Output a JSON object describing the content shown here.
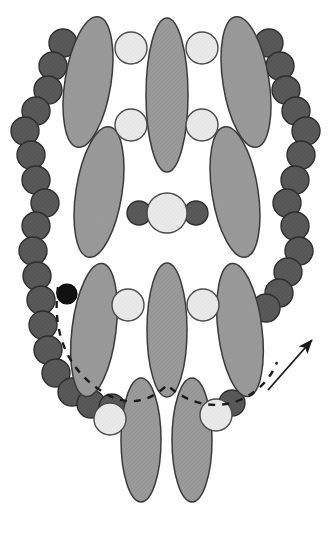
{
  "figure": {
    "background_color": "#ffffff",
    "width": 334,
    "height": 534
  },
  "palette": {
    "ellipse_fill": "#9a9a9a",
    "ellipse_stroke": "#3a3a3a",
    "dark_circle_fill": "#595959",
    "dark_circle_stroke": "#2e2e2e",
    "light_circle_fill": "#e9e9e9",
    "light_circle_stroke": "#4a4a4a",
    "black_circle_fill": "#111111",
    "black_circle_stroke": "#000000",
    "dashed_curve_color": "#1a1a1a",
    "arrow_color": "#1a1a1a"
  },
  "ellipses": [
    {
      "name": "ellipse-upper-left-outer",
      "cx": 88,
      "cy": 82,
      "rx": 23,
      "ry": 66,
      "rotate": 9
    },
    {
      "name": "ellipse-upper-left-inner",
      "cx": 99,
      "cy": 192,
      "rx": 23,
      "ry": 66,
      "rotate": 9
    },
    {
      "name": "ellipse-upper-center",
      "cx": 167,
      "cy": 95,
      "rx": 21,
      "ry": 77,
      "rotate": 0
    },
    {
      "name": "ellipse-upper-right-outer",
      "cx": 246,
      "cy": 82,
      "rx": 23,
      "ry": 66,
      "rotate": -9
    },
    {
      "name": "ellipse-upper-right-inner",
      "cx": 235,
      "cy": 192,
      "rx": 23,
      "ry": 66,
      "rotate": -9
    },
    {
      "name": "ellipse-lower-left",
      "cx": 94,
      "cy": 330,
      "rx": 22,
      "ry": 67,
      "rotate": 7
    },
    {
      "name": "ellipse-lower-center",
      "cx": 167,
      "cy": 330,
      "rx": 20,
      "ry": 67,
      "rotate": 0
    },
    {
      "name": "ellipse-lower-right",
      "cx": 240,
      "cy": 330,
      "rx": 22,
      "ry": 67,
      "rotate": -7
    },
    {
      "name": "ellipse-bottom-left",
      "cx": 141,
      "cy": 440,
      "rx": 20,
      "ry": 62,
      "rotate": 0
    },
    {
      "name": "ellipse-bottom-right",
      "cx": 192,
      "cy": 440,
      "rx": 20,
      "ry": 62,
      "rotate": 0
    }
  ],
  "dark_circles": [
    {
      "name": "dark-circle-l-01",
      "cx": 63,
      "cy": 43,
      "r": 14
    },
    {
      "name": "dark-circle-l-02",
      "cx": 53,
      "cy": 66,
      "r": 14
    },
    {
      "name": "dark-circle-l-03",
      "cx": 48,
      "cy": 90,
      "r": 14
    },
    {
      "name": "dark-circle-l-04",
      "cx": 36,
      "cy": 111,
      "r": 14
    },
    {
      "name": "dark-circle-l-05",
      "cx": 25,
      "cy": 131,
      "r": 14
    },
    {
      "name": "dark-circle-l-06",
      "cx": 31,
      "cy": 155,
      "r": 14
    },
    {
      "name": "dark-circle-l-07",
      "cx": 36,
      "cy": 180,
      "r": 14
    },
    {
      "name": "dark-circle-l-08",
      "cx": 45,
      "cy": 203,
      "r": 14
    },
    {
      "name": "dark-circle-l-09",
      "cx": 36,
      "cy": 226,
      "r": 14
    },
    {
      "name": "dark-circle-l-10",
      "cx": 33,
      "cy": 251,
      "r": 14
    },
    {
      "name": "dark-circle-l-11",
      "cx": 37,
      "cy": 276,
      "r": 14
    },
    {
      "name": "dark-circle-l-12",
      "cx": 41,
      "cy": 300,
      "r": 14
    },
    {
      "name": "dark-circle-l-13",
      "cx": 43,
      "cy": 325,
      "r": 14
    },
    {
      "name": "dark-circle-l-14",
      "cx": 48,
      "cy": 350,
      "r": 14
    },
    {
      "name": "dark-circle-l-15",
      "cx": 56,
      "cy": 373,
      "r": 14
    },
    {
      "name": "dark-circle-l-16",
      "cx": 72,
      "cy": 392,
      "r": 14
    },
    {
      "name": "dark-circle-l-17",
      "cx": 91,
      "cy": 404,
      "r": 14
    },
    {
      "name": "dark-circle-r-01",
      "cx": 269,
      "cy": 43,
      "r": 14
    },
    {
      "name": "dark-circle-r-02",
      "cx": 280,
      "cy": 66,
      "r": 14
    },
    {
      "name": "dark-circle-r-03",
      "cx": 286,
      "cy": 90,
      "r": 14
    },
    {
      "name": "dark-circle-r-04",
      "cx": 296,
      "cy": 111,
      "r": 14
    },
    {
      "name": "dark-circle-r-05",
      "cx": 306,
      "cy": 131,
      "r": 14
    },
    {
      "name": "dark-circle-r-06",
      "cx": 301,
      "cy": 155,
      "r": 14
    },
    {
      "name": "dark-circle-r-07",
      "cx": 295,
      "cy": 180,
      "r": 14
    },
    {
      "name": "dark-circle-r-08",
      "cx": 287,
      "cy": 203,
      "r": 14
    },
    {
      "name": "dark-circle-r-09",
      "cx": 295,
      "cy": 226,
      "r": 14
    },
    {
      "name": "dark-circle-r-10",
      "cx": 299,
      "cy": 251,
      "r": 14
    },
    {
      "name": "dark-circle-r-11",
      "cx": 288,
      "cy": 272,
      "r": 14
    },
    {
      "name": "dark-circle-r-12",
      "cx": 279,
      "cy": 293,
      "r": 14
    },
    {
      "name": "dark-circle-r-13",
      "cx": 266,
      "cy": 308,
      "r": 14
    },
    {
      "name": "dark-circle-bl-edge",
      "cx": 112,
      "cy": 407,
      "r": 13
    },
    {
      "name": "dark-circle-br-edge",
      "cx": 232,
      "cy": 403,
      "r": 13
    },
    {
      "name": "dark-circle-mid-left",
      "cx": 139,
      "cy": 213,
      "r": 12
    },
    {
      "name": "dark-circle-mid-right",
      "cx": 196,
      "cy": 213,
      "r": 12
    }
  ],
  "black_circles": [
    {
      "name": "black-circle-marker",
      "cx": 67,
      "cy": 294,
      "r": 10
    }
  ],
  "light_circles": [
    {
      "name": "light-circle-tl",
      "cx": 131,
      "cy": 48,
      "r": 16
    },
    {
      "name": "light-circle-tr",
      "cx": 202,
      "cy": 48,
      "r": 16
    },
    {
      "name": "light-circle-ml",
      "cx": 131,
      "cy": 125,
      "r": 16
    },
    {
      "name": "light-circle-mr",
      "cx": 202,
      "cy": 125,
      "r": 16
    },
    {
      "name": "light-circle-center",
      "cx": 167,
      "cy": 213,
      "r": 20
    },
    {
      "name": "light-circle-bl",
      "cx": 128,
      "cy": 305,
      "r": 16
    },
    {
      "name": "light-circle-br",
      "cx": 203,
      "cy": 305,
      "r": 16
    },
    {
      "name": "light-circle-bot-left",
      "cx": 110,
      "cy": 419,
      "r": 16
    },
    {
      "name": "light-circle-bot-right",
      "cx": 216,
      "cy": 415,
      "r": 16
    }
  ],
  "dashed_curve": {
    "name": "dashed-boundary-curve",
    "description": "dashed arc tracing the lower boundary through the circle chain",
    "path": "M 58 287 C 52 330, 66 368, 100 390 C 128 410, 152 400, 167 385 C 184 400, 210 412, 240 400 C 262 390, 272 375, 277 362",
    "dash_pattern": "7 7",
    "stroke_width": 2.4
  },
  "arrow": {
    "name": "pointer-arrow",
    "start": {
      "x": 268,
      "y": 390
    },
    "end": {
      "x": 312,
      "y": 340
    },
    "stroke_width": 1.8,
    "head_size": 9
  }
}
